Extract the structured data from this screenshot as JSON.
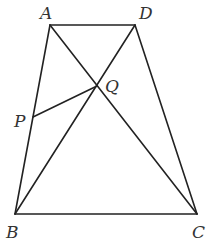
{
  "diagram": {
    "type": "geometry",
    "stroke_color": "#222222",
    "label_color": "#333333",
    "points": {
      "A": {
        "label": "A",
        "x": 50,
        "y": 25,
        "lx": 40,
        "ly": 19
      },
      "D": {
        "label": "D",
        "x": 135,
        "y": 25,
        "lx": 139,
        "ly": 19
      },
      "B": {
        "label": "B",
        "x": 15,
        "y": 214,
        "lx": 6,
        "ly": 238
      },
      "C": {
        "label": "C",
        "x": 197,
        "y": 214,
        "lx": 192,
        "ly": 238
      },
      "P": {
        "label": "P",
        "x": 33,
        "y": 117,
        "lx": 14,
        "ly": 127
      },
      "Q": {
        "label": "Q",
        "x": 97,
        "y": 86,
        "lx": 105,
        "ly": 92
      }
    },
    "segments": [
      [
        "A",
        "D"
      ],
      [
        "A",
        "B"
      ],
      [
        "D",
        "C"
      ],
      [
        "B",
        "C"
      ],
      [
        "A",
        "C"
      ],
      [
        "B",
        "D"
      ],
      [
        "P",
        "Q"
      ]
    ]
  }
}
